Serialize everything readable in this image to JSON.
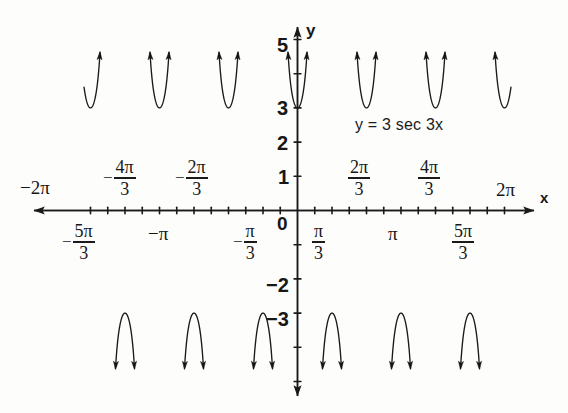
{
  "figure": {
    "equation_label": "y = 3 sec 3x",
    "x_axis_label": "x",
    "y_axis_label": "y",
    "origin_label": "0",
    "background_color": "#fdfdfc",
    "curve_color": "#1a1a1a",
    "axis_color": "#1a1a1a"
  },
  "chart_data": {
    "type": "line",
    "title": "y = 3 sec 3x",
    "function": "y = 3*sec(3x)",
    "xlabel": "x",
    "ylabel": "y",
    "xlim": [
      -6.8068,
      6.8068
    ],
    "ylim": [
      -6.0,
      5.8
    ],
    "amplitude": 3,
    "period": 2.0944,
    "grid": false,
    "legend": false,
    "asymptotes_x": [
      -6.2832,
      -5.236,
      -4.1888,
      -3.1416,
      -2.0944,
      -1.0472,
      -0.5236,
      0.5236,
      1.0472,
      2.0944,
      3.1416,
      4.1888,
      5.236,
      6.2832
    ],
    "asymptote_expression": "x = pi/6 + k*pi/3",
    "minima_upper_branches_y": 3,
    "maxima_lower_branches_y": -3,
    "x_tick_values": [
      -6.2832,
      -5.236,
      -4.1888,
      -3.1416,
      -2.0944,
      -1.0472,
      0,
      1.0472,
      2.0944,
      3.1416,
      4.1888,
      5.236,
      6.2832
    ],
    "x_tick_minor_step": 0.5236,
    "y_tick_values": [
      -5,
      -4,
      -3,
      -2,
      -1,
      0,
      1,
      2,
      3,
      4,
      5
    ],
    "x_labels_above": [
      {
        "text": "-2π",
        "value": -6.2832,
        "display": "minus2pi"
      },
      {
        "text": "-4π/3",
        "value": -4.1888,
        "display": "fraction"
      },
      {
        "text": "-2π/3",
        "value": -2.0944,
        "display": "fraction"
      },
      {
        "text": "2π/3",
        "value": 2.0944,
        "display": "fraction"
      },
      {
        "text": "4π/3",
        "value": 4.1888,
        "display": "fraction"
      },
      {
        "text": "2π",
        "value": 6.2832,
        "display": "plain"
      }
    ],
    "x_labels_below": [
      {
        "text": "-5π/3",
        "value": -5.236,
        "display": "fraction"
      },
      {
        "text": "-π",
        "value": -3.1416,
        "display": "plain"
      },
      {
        "text": "-π/3",
        "value": -1.0472,
        "display": "fraction"
      },
      {
        "text": "π/3",
        "value": 1.0472,
        "display": "fraction"
      },
      {
        "text": "π",
        "value": 3.1416,
        "display": "plain"
      },
      {
        "text": "5π/3",
        "value": 5.236,
        "display": "fraction"
      }
    ],
    "y_labels": [
      {
        "text": "5",
        "value": 5
      },
      {
        "text": "3",
        "value": 3
      },
      {
        "text": "2",
        "value": 2
      },
      {
        "text": "1",
        "value": 1
      },
      {
        "text": "-2",
        "value": -2
      },
      {
        "text": "-3",
        "value": -3
      }
    ]
  },
  "ticks": {
    "x_negative_2pi": "−2π",
    "x_positive_2pi": "2π",
    "pi_glyph": "π",
    "minus_glyph": "−",
    "three": "3",
    "five": "5",
    "four": "4",
    "two": "2",
    "one": "1",
    "neg_two": "−2",
    "neg_three": "−3",
    "neg_pi": "−π"
  }
}
